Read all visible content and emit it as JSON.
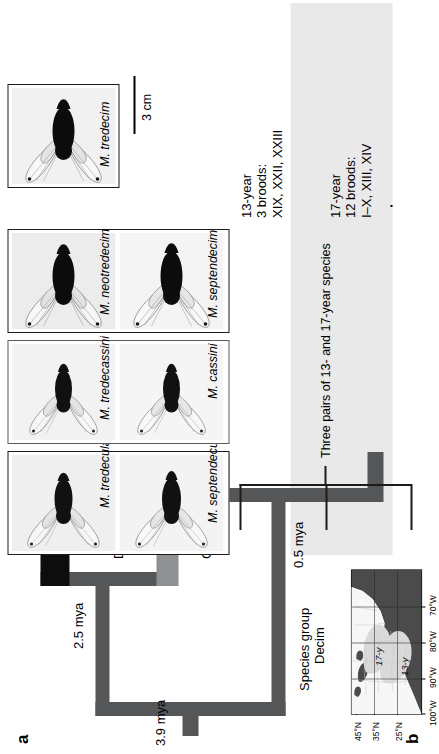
{
  "figure": {
    "panel_a_letter": "a",
    "panel_b_letter": "b"
  },
  "tree": {
    "nodes": [
      {
        "label": "3.9 mya"
      },
      {
        "label": "2.5 mya"
      },
      {
        "label": "0.5 mya"
      }
    ],
    "root_age_label": "3.9 mya",
    "decula_node_label": "2.5 mya",
    "decim_node_label": "0.5 mya",
    "clades": [
      {
        "name": "Decula",
        "color": "#0d0d0d"
      },
      {
        "name": "Cassini",
        "color": "#8e9092"
      },
      {
        "name": "Species group\nDecim",
        "color": "#555658"
      }
    ],
    "clade_decula": "Decula",
    "clade_cassini": "Cassini",
    "clade_decim_line1": "Species group",
    "clade_decim_line2": "Decim"
  },
  "species": {
    "boxes": [
      {
        "group": "decula",
        "thirteen_year": "M. tredecula",
        "seventeen_year": "M. septendecula"
      },
      {
        "group": "cassini",
        "thirteen_year": "M. tredecassini",
        "seventeen_year": "M. cassini"
      },
      {
        "group": "decim",
        "thirteen_year": "M. neotredecim",
        "seventeen_year": "M. septendecim"
      },
      {
        "group": "decim-single",
        "thirteen_year": "M. tredecim",
        "seventeen_year": ""
      }
    ],
    "names": {
      "tredecula": "M. tredecula",
      "septendecula": "M. septendecula",
      "tredecassini": "M. tredecassini",
      "cassini": "M. cassini",
      "neotredecim": "M. neotredecim",
      "septendecim": "M. septendecim",
      "tredecim": "M. tredecim"
    }
  },
  "annotations": {
    "life_cycles": [
      {
        "cycle": "13-year",
        "brood_count": "3 broods:",
        "brood_list": "XIX, XXII, XXIII"
      },
      {
        "cycle": "17-year",
        "brood_count": "12 broods:",
        "brood_list": "I–X, XIII, XIV"
      }
    ],
    "pairs_bracket": "Three pairs of 13- and 17-year species",
    "scale_bar": "3 cm"
  },
  "map": {
    "latitude_ticks": [
      "45°N",
      "35°N",
      "25°N"
    ],
    "longitude_ticks": [
      "100°W",
      "90°W",
      "80°W",
      "70°W"
    ],
    "region_labels": [
      "17-y",
      "13-y"
    ],
    "region_17": "17-y",
    "region_13": "13-y",
    "colors": {
      "ocean": "#4b4b4b",
      "land": "#f4f4f4",
      "region_shade": "#d9d9d9"
    }
  },
  "colors": {
    "branch_dark": "#555658",
    "branch_black": "#0d0d0d",
    "branch_grey": "#8e9092",
    "band_shade": "#e9e9e9",
    "outline": "#1b1b1b"
  }
}
